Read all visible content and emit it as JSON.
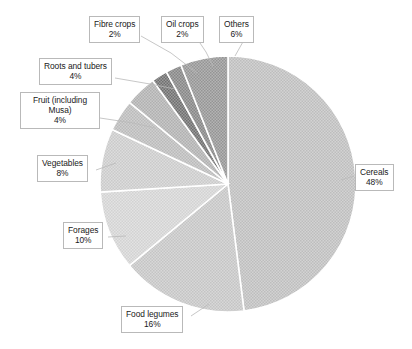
{
  "chart_data": {
    "type": "pie",
    "title": "",
    "subtitle": "",
    "xlabel": "",
    "ylabel": "",
    "legend_position": "none",
    "grid": false,
    "start_angle_deg": 0,
    "direction": "clockwise",
    "units": "percent",
    "categories": [
      "Cereals",
      "Food legumes",
      "Forages",
      "Vegetables",
      "Fruit (including Musa)",
      "Roots and tubers",
      "Fibre crops",
      "Oil crops",
      "Others"
    ],
    "values": [
      48,
      16,
      10,
      8,
      4,
      4,
      2,
      2,
      6
    ],
    "value_labels": [
      "48%",
      "16%",
      "10%",
      "8%",
      "4%",
      "4%",
      "2%",
      "2%",
      "6%"
    ],
    "slice_colors": [
      "#c9c9c9",
      "#cfcfcf",
      "#dcdcdc",
      "#d4d4d4",
      "#c4c4c4",
      "#bdbdbd",
      "#8c8c8c",
      "#9a9a9a",
      "#a6a6a6"
    ],
    "slice_separator_color": "#ffffff",
    "slices": [
      {
        "label": "Cereals",
        "value": 48,
        "value_label": "48%",
        "color": "#c9c9c9"
      },
      {
        "label": "Food legumes",
        "value": 16,
        "value_label": "16%",
        "color": "#cfcfcf"
      },
      {
        "label": "Forages",
        "value": 10,
        "value_label": "10%",
        "color": "#dcdcdc"
      },
      {
        "label": "Vegetables",
        "value": 8,
        "value_label": "8%",
        "color": "#d4d4d4"
      },
      {
        "label": "Fruit (including Musa)",
        "value": 4,
        "value_label": "4%",
        "color": "#c4c4c4"
      },
      {
        "label": "Roots and tubers",
        "value": 4,
        "value_label": "4%",
        "color": "#bdbdbd"
      },
      {
        "label": "Fibre crops",
        "value": 2,
        "value_label": "2%",
        "color": "#8c8c8c"
      },
      {
        "label": "Oil crops",
        "value": 2,
        "value_label": "2%",
        "color": "#9a9a9a"
      },
      {
        "label": "Others",
        "value": 6,
        "value_label": "6%",
        "color": "#a6a6a6"
      }
    ]
  },
  "labels": {
    "cereals": {
      "name": "Cereals",
      "pct": "48%"
    },
    "food_legumes": {
      "name": "Food legumes",
      "pct": "16%"
    },
    "forages": {
      "name": "Forages",
      "pct": "10%"
    },
    "vegetables": {
      "name": "Vegetables",
      "pct": "8%"
    },
    "fruit": {
      "name_line1": "Fruit (including",
      "name_line2": "Musa)",
      "pct": "4%"
    },
    "roots_tubers": {
      "name": "Roots and tubers",
      "pct": "4%"
    },
    "fibre_crops": {
      "name": "Fibre crops",
      "pct": "2%"
    },
    "oil_crops": {
      "name": "Oil crops",
      "pct": "2%"
    },
    "others": {
      "name": "Others",
      "pct": "6%"
    }
  }
}
